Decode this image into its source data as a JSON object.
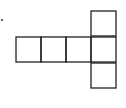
{
  "diagram": {
    "type": "cube-net",
    "stroke_color": "#222222",
    "background": "#ffffff",
    "cell_size": 25,
    "cells": [
      {
        "id": "row-1",
        "x": 16,
        "y": 37
      },
      {
        "id": "row-2",
        "x": 41,
        "y": 37
      },
      {
        "id": "row-3",
        "x": 66,
        "y": 37
      },
      {
        "id": "row-4",
        "x": 91,
        "y": 37
      },
      {
        "id": "top",
        "x": 91,
        "y": 11
      },
      {
        "id": "bottom",
        "x": 91,
        "y": 63
      }
    ],
    "marker": {
      "x": 1,
      "y": 19
    }
  }
}
